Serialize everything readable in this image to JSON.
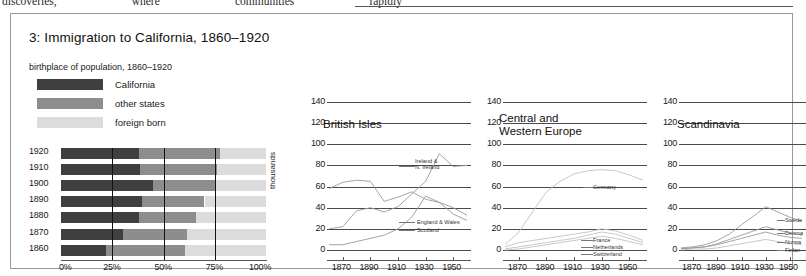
{
  "page_top_text": {
    "words": [
      "discoveries,",
      "where",
      "communities",
      "rapidly"
    ]
  },
  "figure": {
    "title": "3: Immigration to California, 1860–1920",
    "subtitle": "birthplace of population, 1860–1920",
    "legend": [
      {
        "label": "California",
        "color": "#3f3f3f"
      },
      {
        "label": "other states",
        "color": "#8d8d8d"
      },
      {
        "label": "foreign born",
        "color": "#dcdcdc"
      }
    ]
  },
  "chart_data": [
    {
      "type": "bar",
      "subtype": "stacked-horizontal-100pct",
      "title": "birthplace of population, 1860–1920",
      "xlabel": "",
      "ylabel": "",
      "categories": [
        "1920",
        "1910",
        "1900",
        "1890",
        "1880",
        "1870",
        "1860"
      ],
      "xtick_labels": [
        "0%",
        "25%",
        "50%",
        "75%",
        "100%"
      ],
      "xlim": [
        0,
        100
      ],
      "gridlines_at": [
        25,
        50,
        75
      ],
      "series": [
        {
          "name": "California",
          "color": "#3f3f3f",
          "values": [
            38,
            38.5,
            45,
            39.5,
            38,
            30,
            22
          ]
        },
        {
          "name": "other states",
          "color": "#8d8d8d",
          "values": [
            39.5,
            37.5,
            30.5,
            30.5,
            28,
            31.5,
            38.5
          ]
        },
        {
          "name": "foreign born",
          "color": "#dcdcdc",
          "values": [
            22.5,
            24,
            24.5,
            30,
            34,
            38.5,
            39.5
          ]
        }
      ]
    },
    {
      "type": "line",
      "title": "British Isles",
      "ylabel": "thousands",
      "ylim": [
        0,
        140
      ],
      "ytick_labels": [
        "0",
        "20",
        "40",
        "60",
        "80",
        "100",
        "120",
        "140"
      ],
      "xlim": [
        1860,
        1960
      ],
      "xtick_labels": [
        "1870",
        "1890",
        "1910",
        "1930",
        "1950"
      ],
      "x": [
        1860,
        1870,
        1880,
        1890,
        1900,
        1910,
        1920,
        1930,
        1940,
        1950,
        1960
      ],
      "series": [
        {
          "name": "Ireland & N. Ireland",
          "values": [
            5,
            5,
            8,
            11,
            14,
            20,
            31,
            51,
            45,
            34,
            28
          ],
          "shade": "mid"
        },
        {
          "name": "England & Wales",
          "values": [
            20,
            22,
            37,
            40,
            36,
            41,
            53,
            65,
            91,
            79,
            80
          ],
          "shade": "mid"
        },
        {
          "name": "Scotland",
          "values": [
            58,
            64,
            66,
            65,
            46,
            50,
            55,
            48,
            45,
            40,
            33
          ],
          "shade": "mid"
        }
      ],
      "annotations": [
        {
          "text": "Ireland &\nN. Ireland"
        },
        {
          "text": "England & Wales"
        },
        {
          "text": "Scotland"
        }
      ]
    },
    {
      "type": "line",
      "title": "Central and\nWestern Europe",
      "ylim": [
        0,
        140
      ],
      "ytick_labels": [
        "0",
        "20",
        "40",
        "60",
        "80",
        "100",
        "120",
        "140"
      ],
      "xtick_labels": [
        "1870",
        "1890",
        "1910",
        "1930",
        "1950"
      ],
      "x": [
        1860,
        1870,
        1880,
        1890,
        1900,
        1910,
        1920,
        1930,
        1940,
        1950,
        1960
      ],
      "series": [
        {
          "name": "Germany",
          "values": [
            5,
            17,
            36,
            55,
            65,
            72,
            75,
            76,
            75,
            71,
            66
          ],
          "shade": "light"
        },
        {
          "name": "France",
          "values": [
            3,
            7,
            9,
            11,
            13,
            15,
            17,
            20,
            18,
            14,
            9
          ],
          "shade": "light"
        },
        {
          "name": "Netherlands",
          "values": [
            1,
            3,
            5,
            7,
            9,
            11,
            14,
            17,
            15,
            11,
            7
          ],
          "shade": "light"
        },
        {
          "name": "Switzerland",
          "values": [
            0,
            1,
            3,
            5,
            7,
            9,
            11,
            13,
            11,
            8,
            5
          ],
          "shade": "light"
        }
      ],
      "annotations": [
        {
          "text": "Germany"
        },
        {
          "text": "France"
        },
        {
          "text": "Netherlands"
        },
        {
          "text": "Switzerland"
        }
      ]
    },
    {
      "type": "line",
      "title": "Scandinavia",
      "ylim": [
        0,
        140
      ],
      "ytick_labels": [
        "0",
        "20",
        "40",
        "60",
        "80",
        "100",
        "120",
        "140"
      ],
      "xtick_labels": [
        "1870",
        "1890",
        "1910",
        "1930",
        "1950"
      ],
      "x": [
        1860,
        1870,
        1880,
        1890,
        1900,
        1910,
        1920,
        1930,
        1940,
        1950,
        1960
      ],
      "series": [
        {
          "name": "Sweden",
          "values": [
            2,
            3,
            5,
            9,
            15,
            24,
            32,
            41,
            36,
            31,
            27
          ],
          "shade": "mid"
        },
        {
          "name": "Denmark",
          "values": [
            1,
            2,
            3,
            6,
            10,
            14,
            18,
            22,
            19,
            16,
            14
          ],
          "shade": "mid"
        },
        {
          "name": "Norway",
          "values": [
            1,
            2,
            3,
            5,
            8,
            11,
            14,
            17,
            14,
            12,
            11
          ],
          "shade": "mid"
        },
        {
          "name": "Finland",
          "values": [
            0,
            1,
            1,
            2,
            4,
            6,
            8,
            10,
            8,
            6,
            5
          ],
          "shade": "light"
        }
      ],
      "annotations": [
        {
          "text": "Swede"
        },
        {
          "text": "Denma"
        },
        {
          "text": "Norwa"
        },
        {
          "text": "Finlan"
        }
      ]
    }
  ]
}
